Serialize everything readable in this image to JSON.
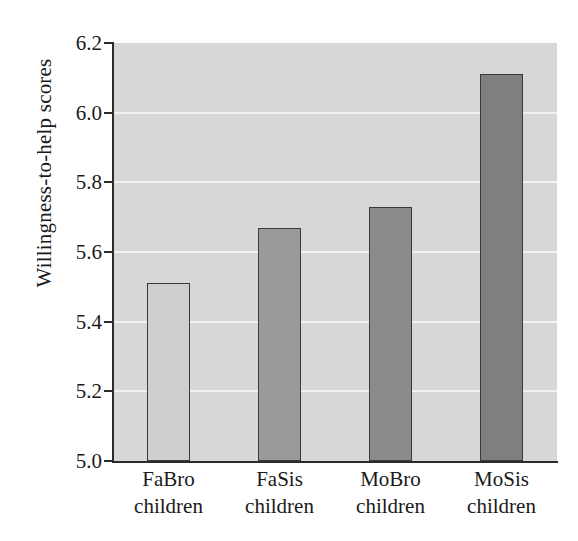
{
  "chart_data": {
    "type": "bar",
    "title": "",
    "xlabel": "",
    "ylabel": "Willingness-to-help scores",
    "categories": [
      "FaBro\nchildren",
      "FaSis\nchildren",
      "MoBro\nchildren",
      "MoSis\nchildren"
    ],
    "category_lines": [
      {
        "line1": "FaBro",
        "line2": "children"
      },
      {
        "line1": "FaSis",
        "line2": "children"
      },
      {
        "line1": "MoBro",
        "line2": "children"
      },
      {
        "line1": "MoSis",
        "line2": "children"
      }
    ],
    "values": [
      5.51,
      5.67,
      5.73,
      6.11
    ],
    "ylim": [
      5.0,
      6.2
    ],
    "yticks": [
      "6.2",
      "6.0",
      "5.8",
      "5.6",
      "5.4",
      "5.2",
      "5.0"
    ],
    "ytick_values": [
      6.2,
      6.0,
      5.8,
      5.6,
      5.4,
      5.2,
      5.0
    ],
    "grid": true,
    "grid_axis": "y",
    "legend": "none",
    "bar_colors": [
      "#cecece",
      "#9a9a9a",
      "#8b8b8b",
      "#7f7f7f"
    ],
    "bar_edge_color": "#3a3a3a",
    "plot_background": "#d7d7d7",
    "gridline_color": "#f2f2f2",
    "axis_color": "#2b2b2b",
    "figure_background": "#ffffff"
  }
}
